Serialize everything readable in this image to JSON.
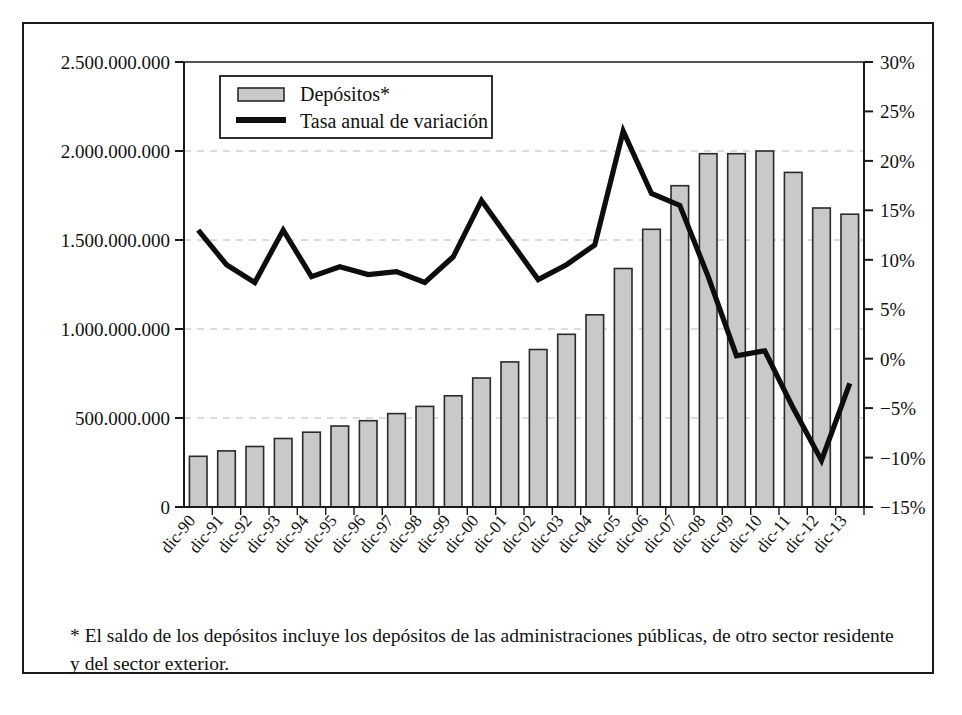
{
  "chart_data": {
    "type": "bar",
    "title": "",
    "xlabel": "",
    "ylabel": "",
    "grid": true,
    "legend_position": "top-left-inside",
    "categories": [
      "dic-90",
      "dic-91",
      "dic-92",
      "dic-93",
      "dic-94",
      "dic-95",
      "dic-96",
      "dic-97",
      "dic-98",
      "dic-99",
      "dic-00",
      "dic-01",
      "dic-02",
      "dic-03",
      "dic-04",
      "dic-05",
      "dic-06",
      "dic-07",
      "dic-08",
      "dic-09",
      "dic-10",
      "dic-11",
      "dic-12",
      "dic-13"
    ],
    "left_axis": {
      "label": "",
      "ylim": [
        0,
        2500000000
      ],
      "ticks": [
        0,
        500000000,
        1000000000,
        1500000000,
        2000000000,
        2500000000
      ],
      "tick_labels": [
        "0",
        "500.000.000",
        "1.000.000.000",
        "1.500.000.000",
        "2.000.000.000",
        "2.500.000.000"
      ]
    },
    "right_axis": {
      "label": "",
      "ylim": [
        -15,
        30
      ],
      "ticks": [
        -15,
        -10,
        -5,
        0,
        5,
        10,
        15,
        20,
        25,
        30
      ],
      "tick_labels": [
        "−15%",
        "−10%",
        "−5%",
        "0%",
        "5%",
        "10%",
        "15%",
        "20%",
        "25%",
        "30%"
      ]
    },
    "series": [
      {
        "name": "Depósitos*",
        "type": "bar",
        "axis": "left",
        "color": "#c9c9c9",
        "edge_color": "#2a2a2a",
        "values": [
          285000000,
          315000000,
          340000000,
          385000000,
          420000000,
          455000000,
          485000000,
          525000000,
          565000000,
          625000000,
          725000000,
          815000000,
          885000000,
          970000000,
          1080000000,
          1340000000,
          1560000000,
          1805000000,
          1985000000,
          1985000000,
          2000000000,
          1880000000,
          1680000000,
          1645000000
        ]
      },
      {
        "name": "Tasa anual de variación",
        "type": "line",
        "axis": "right",
        "color": "#0d0d0d",
        "values": [
          13.0,
          9.5,
          7.7,
          13.0,
          8.3,
          9.3,
          8.5,
          8.8,
          7.7,
          10.3,
          16.0,
          12.0,
          8.0,
          9.5,
          11.5,
          23.0,
          16.7,
          15.5,
          8.3,
          0.3,
          0.8,
          -5.0,
          -10.3,
          -2.5
        ]
      }
    ],
    "annotations": []
  },
  "legend": {
    "items": [
      {
        "label": "Depósitos*",
        "marker": "bar-swatch"
      },
      {
        "label": "Tasa anual de variación",
        "marker": "line-swatch"
      }
    ]
  },
  "footnote": {
    "text": "*  El saldo de los depósitos incluye los depósitos de las administraciones públicas, de otro sector residente y del sector exterior."
  },
  "colors": {
    "bar_fill": "#c9c9c9",
    "bar_edge": "#2a2a2a",
    "line": "#0d0d0d",
    "grid": "#b8b8b8",
    "axis": "#1a1a1a",
    "frame": "#1a1a1a",
    "background": "#ffffff"
  }
}
